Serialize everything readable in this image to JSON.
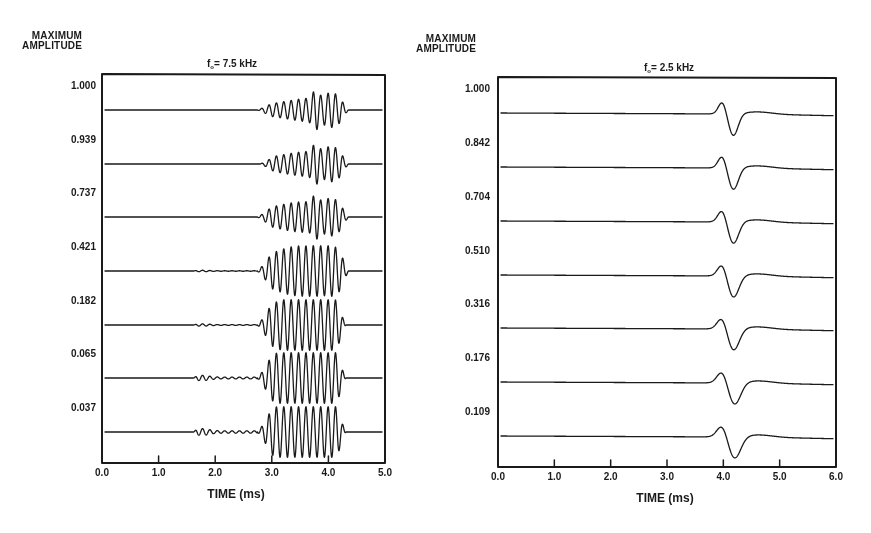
{
  "chart_data": [
    {
      "type": "line",
      "title": "f0= 7.5 kHz",
      "title_main": "f",
      "title_sub": "o",
      "title_rest": "= 7.5 kHz",
      "ylabel": "MAXIMUM AMPLITUDE",
      "ylabel_line1": "MAXIMUM",
      "ylabel_line2": "AMPLITUDE",
      "xlabel": "TIME (ms)",
      "xlim": [
        0.0,
        5.0
      ],
      "x_ticks": [
        "0.0",
        "1.0",
        "2.0",
        "3.0",
        "4.0",
        "5.0"
      ],
      "grid": false,
      "legend": "none",
      "series": [
        {
          "name": "1.000",
          "max_amplitude": 1.0,
          "early_packet": 0.0,
          "main_start_ms": 2.75,
          "peak_ms": 3.8,
          "end_ms": 4.4
        },
        {
          "name": "0.939",
          "max_amplitude": 0.939,
          "early_packet": 0.0,
          "main_start_ms": 2.8,
          "peak_ms": 3.8,
          "end_ms": 4.4
        },
        {
          "name": "0.737",
          "max_amplitude": 0.737,
          "early_packet": 0.0,
          "main_start_ms": 2.75,
          "peak_ms": 3.8,
          "end_ms": 4.4
        },
        {
          "name": "0.421",
          "max_amplitude": 0.421,
          "early_packet": 0.1,
          "main_start_ms": 2.75,
          "peak_ms": 3.8,
          "end_ms": 4.4
        },
        {
          "name": "0.182",
          "max_amplitude": 0.182,
          "early_packet": 0.15,
          "main_start_ms": 2.75,
          "peak_ms": 3.8,
          "end_ms": 4.35
        },
        {
          "name": "0.065",
          "max_amplitude": 0.065,
          "early_packet": 0.35,
          "main_start_ms": 2.75,
          "peak_ms": 3.8,
          "end_ms": 4.35
        },
        {
          "name": "0.037",
          "max_amplitude": 0.037,
          "early_packet": 0.45,
          "main_start_ms": 2.75,
          "peak_ms": 3.8,
          "end_ms": 4.35
        }
      ],
      "amplitude_labels": [
        "1.000",
        "0.939",
        "0.737",
        "0.421",
        "0.182",
        "0.065",
        "0.037"
      ]
    },
    {
      "type": "line",
      "title": "f0= 2.5 kHz",
      "title_main": "f",
      "title_sub": "o",
      "title_rest": "= 2.5 kHz",
      "ylabel": "MAXIMUM AMPLITUDE",
      "ylabel_line1": "MAXIMUM",
      "ylabel_line2": "AMPLITUDE",
      "xlabel": "TIME (ms)",
      "xlim": [
        0.0,
        6.0
      ],
      "x_ticks": [
        "0.0",
        "1.0",
        "2.0",
        "3.0",
        "4.0",
        "5.0",
        "6.0"
      ],
      "grid": false,
      "legend": "none",
      "series": [
        {
          "name": "1.000",
          "max_amplitude": 1.0,
          "pulse_peak_ms": 4.0,
          "pulse_trough_ms": 4.2
        },
        {
          "name": "0.842",
          "max_amplitude": 0.842,
          "pulse_peak_ms": 4.0,
          "pulse_trough_ms": 4.2
        },
        {
          "name": "0.704",
          "max_amplitude": 0.704,
          "pulse_peak_ms": 4.0,
          "pulse_trough_ms": 4.2
        },
        {
          "name": "0.510",
          "max_amplitude": 0.51,
          "pulse_peak_ms": 4.0,
          "pulse_trough_ms": 4.2
        },
        {
          "name": "0.316",
          "max_amplitude": 0.316,
          "pulse_peak_ms": 4.0,
          "pulse_trough_ms": 4.2
        },
        {
          "name": "0.176",
          "max_amplitude": 0.176,
          "pulse_peak_ms": 4.0,
          "pulse_trough_ms": 4.22
        },
        {
          "name": "0.109",
          "max_amplitude": 0.109,
          "pulse_peak_ms": 4.0,
          "pulse_trough_ms": 4.22
        }
      ],
      "amplitude_labels": [
        "1.000",
        "0.842",
        "0.704",
        "0.510",
        "0.316",
        "0.176",
        "0.109"
      ]
    }
  ],
  "left_panel": {
    "ylabel_line1": "MAXIMUM",
    "ylabel_line2": "AMPLITUDE",
    "title_main": "f",
    "title_sub": "o",
    "title_rest": "= 7.5 kHz",
    "xlabel": "TIME (ms)",
    "x_ticks": [
      "0.0",
      "1.0",
      "2.0",
      "3.0",
      "4.0",
      "5.0"
    ],
    "amplitude_labels": [
      "1.000",
      "0.939",
      "0.737",
      "0.421",
      "0.182",
      "0.065",
      "0.037"
    ]
  },
  "right_panel": {
    "ylabel_line1": "MAXIMUM",
    "ylabel_line2": "AMPLITUDE",
    "title_main": "f",
    "title_sub": "o",
    "title_rest": "= 2.5 kHz",
    "xlabel": "TIME (ms)",
    "x_ticks": [
      "0.0",
      "1.0",
      "2.0",
      "3.0",
      "4.0",
      "5.0",
      "6.0"
    ],
    "amplitude_labels": [
      "1.000",
      "0.842",
      "0.704",
      "0.510",
      "0.316",
      "0.176",
      "0.109"
    ]
  },
  "colors": {
    "ink": "#1a1a1a",
    "background": "#ffffff"
  }
}
